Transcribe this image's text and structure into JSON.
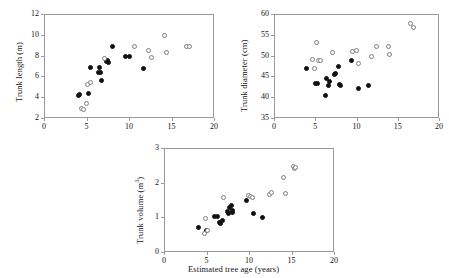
{
  "figure": {
    "background": "#ffffff",
    "marker_filled_color": "#111111",
    "marker_open_color": "#7d7d7d",
    "axis_color": "#9a9a9a",
    "shared_xlabel": "Estimated tree age (years)"
  },
  "chart_data": [
    {
      "type": "scatter",
      "panel": "top-left",
      "title": "",
      "xlabel": "",
      "ylabel": "Trunk length (m)",
      "xlim": [
        0,
        20
      ],
      "ylim": [
        2,
        12
      ],
      "xticks": [
        0,
        5,
        10,
        15,
        20
      ],
      "yticks": [
        2,
        4,
        6,
        8,
        10,
        12
      ],
      "grid": false,
      "legend": "none",
      "series": [
        {
          "name": "filled",
          "marker": "filled-circle",
          "points": [
            [
              4.1,
              4.2
            ],
            [
              4.2,
              4.3
            ],
            [
              5.2,
              4.4
            ],
            [
              5.5,
              6.9
            ],
            [
              6.4,
              6.4
            ],
            [
              6.5,
              6.9
            ],
            [
              6.6,
              6.4
            ],
            [
              6.8,
              5.6
            ],
            [
              7.3,
              7.4
            ],
            [
              7.5,
              7.5
            ],
            [
              7.6,
              7.3
            ],
            [
              8.1,
              8.9
            ],
            [
              9.6,
              7.9
            ],
            [
              10.0,
              7.9
            ],
            [
              11.7,
              6.8
            ]
          ]
        },
        {
          "name": "open",
          "marker": "open-circle",
          "points": [
            [
              4.4,
              2.9
            ],
            [
              4.6,
              2.8
            ],
            [
              5.0,
              3.4
            ],
            [
              5.1,
              5.2
            ],
            [
              5.5,
              5.4
            ],
            [
              7.1,
              7.7
            ],
            [
              10.6,
              8.9
            ],
            [
              12.3,
              8.5
            ],
            [
              12.7,
              7.8
            ],
            [
              14.2,
              9.9
            ],
            [
              14.4,
              8.3
            ],
            [
              16.8,
              8.9
            ],
            [
              17.1,
              8.9
            ]
          ]
        }
      ]
    },
    {
      "type": "scatter",
      "panel": "top-right",
      "title": "",
      "xlabel": "",
      "ylabel": "Trunk diameter (cm)",
      "xlim": [
        0,
        20
      ],
      "ylim": [
        35,
        60
      ],
      "xticks": [
        0,
        5,
        10,
        15,
        20
      ],
      "yticks": [
        35,
        40,
        45,
        50,
        55,
        60
      ],
      "grid": false,
      "legend": "none",
      "series": [
        {
          "name": "filled",
          "marker": "filled-circle",
          "points": [
            [
              3.9,
              46.9
            ],
            [
              5.0,
              43.3
            ],
            [
              5.3,
              43.4
            ],
            [
              6.3,
              40.3
            ],
            [
              6.4,
              44.6
            ],
            [
              6.6,
              42.9
            ],
            [
              6.7,
              43.7
            ],
            [
              7.3,
              45.4
            ],
            [
              7.5,
              45.7
            ],
            [
              7.8,
              47.4
            ],
            [
              7.9,
              43.0
            ],
            [
              8.0,
              42.9
            ],
            [
              9.4,
              48.8
            ],
            [
              10.2,
              42.2
            ],
            [
              11.4,
              42.7
            ]
          ]
        },
        {
          "name": "open",
          "marker": "open-circle",
          "points": [
            [
              4.7,
              49.0
            ],
            [
              4.9,
              47.0
            ],
            [
              5.1,
              53.2
            ],
            [
              5.4,
              48.8
            ],
            [
              5.6,
              48.8
            ],
            [
              7.1,
              50.8
            ],
            [
              9.5,
              51.0
            ],
            [
              10.0,
              51.3
            ],
            [
              10.3,
              48.1
            ],
            [
              11.8,
              49.8
            ],
            [
              12.4,
              52.1
            ],
            [
              13.9,
              52.2
            ],
            [
              14.0,
              50.2
            ],
            [
              16.5,
              57.8
            ],
            [
              16.9,
              56.8
            ]
          ]
        }
      ]
    },
    {
      "type": "scatter",
      "panel": "bottom",
      "title": "",
      "xlabel": "Estimated tree age (years)",
      "ylabel": "Trunk volume (m3)",
      "ylabel_base": "Trunk volume (m",
      "ylabel_sup": "3",
      "ylabel_tail": ")",
      "xlim": [
        0,
        20
      ],
      "ylim": [
        0,
        3
      ],
      "xticks": [
        0,
        5,
        10,
        15,
        20
      ],
      "yticks": [
        0,
        1,
        2,
        3
      ],
      "grid": false,
      "legend": "none",
      "series": [
        {
          "name": "filled",
          "marker": "filled-circle",
          "points": [
            [
              4.0,
              0.72
            ],
            [
              5.0,
              0.62
            ],
            [
              5.9,
              1.02
            ],
            [
              6.3,
              1.03
            ],
            [
              6.5,
              0.86
            ],
            [
              6.6,
              0.82
            ],
            [
              6.9,
              0.92
            ],
            [
              7.5,
              1.18
            ],
            [
              7.6,
              1.12
            ],
            [
              7.7,
              1.27
            ],
            [
              7.9,
              1.35
            ],
            [
              8.0,
              1.21
            ],
            [
              8.1,
              1.14
            ],
            [
              9.7,
              1.48
            ],
            [
              10.5,
              1.1
            ],
            [
              11.6,
              0.99
            ]
          ]
        },
        {
          "name": "open",
          "marker": "open-circle",
          "points": [
            [
              4.8,
              0.53
            ],
            [
              4.9,
              0.98
            ],
            [
              5.1,
              0.62
            ],
            [
              7.0,
              1.58
            ],
            [
              9.9,
              1.62
            ],
            [
              10.2,
              1.6
            ],
            [
              10.4,
              1.58
            ],
            [
              12.4,
              1.66
            ],
            [
              12.7,
              1.73
            ],
            [
              14.1,
              2.15
            ],
            [
              14.3,
              1.7
            ],
            [
              15.2,
              2.48
            ],
            [
              15.4,
              2.42
            ],
            [
              15.5,
              2.43
            ]
          ]
        }
      ]
    }
  ]
}
